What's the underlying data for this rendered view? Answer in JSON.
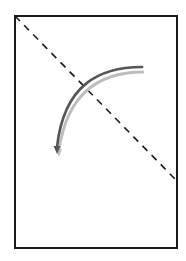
{
  "diagram": {
    "colors": {
      "frame": "#1a1a1a",
      "dashed_line": "#1a1a1a",
      "arrow_dark": "#555555",
      "arrow_light": "#bdbdbd",
      "background": "#ffffff"
    },
    "elements": [
      {
        "name": "page-frame",
        "kind": "rectangle"
      },
      {
        "name": "fold-line",
        "kind": "dashed-line"
      },
      {
        "name": "curved-arrow",
        "kind": "arc-arrow",
        "direction": "counter-clockwise, top-right to bottom-left"
      },
      {
        "name": "curved-arrow-shadow",
        "kind": "arc-arrow"
      }
    ]
  }
}
